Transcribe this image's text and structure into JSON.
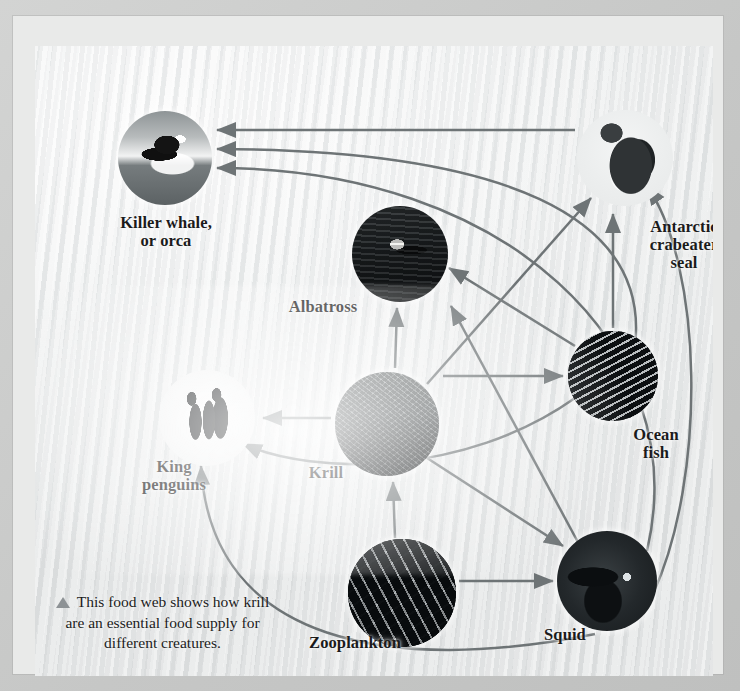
{
  "figure": {
    "type": "diagram",
    "caption_bullet": "triangle-bullet",
    "caption": "This food web\nshows how krill are an\nessential food supply\nfor different creatures.",
    "arrow_color": "#6e7476",
    "label_color": "#1b1b1b",
    "background_color": "#eceeee",
    "mat_color": "#c9cac9"
  },
  "nodes": [
    {
      "id": "orca",
      "label": "Killer whale,\nor orca",
      "photo": "breaching killer whale",
      "cx": 130,
      "cy": 112,
      "r": 47,
      "label_x": 36,
      "label_y": 168,
      "label_w": 190
    },
    {
      "id": "albatross",
      "label": "Albatross",
      "photo": "albatross in flight",
      "cx": 365,
      "cy": 208,
      "r": 48,
      "label_x": 218,
      "label_y": 252,
      "label_w": 140
    },
    {
      "id": "seal",
      "label": "Antarctic\ncrabeater\nseal",
      "photo": "crabeater seal on ice",
      "cx": 590,
      "cy": 112,
      "r": 48,
      "label_x": 584,
      "label_y": 172,
      "label_w": 130
    },
    {
      "id": "penguins",
      "label": "King\npenguins",
      "photo": "king penguins",
      "cx": 172,
      "cy": 372,
      "r": 48,
      "label_x": 74,
      "label_y": 412,
      "label_w": 130
    },
    {
      "id": "krill",
      "label": "Krill",
      "photo": "swarm of krill",
      "cx": 352,
      "cy": 378,
      "r": 52,
      "label_x": 246,
      "label_y": 418,
      "label_w": 90
    },
    {
      "id": "oceanfish",
      "label": "Ocean\nfish",
      "photo": "shoal of ocean fish",
      "cx": 578,
      "cy": 330,
      "r": 45,
      "label_x": 576,
      "label_y": 380,
      "label_w": 90
    },
    {
      "id": "zooplankton",
      "label": "Zooplankton",
      "photo": "zooplankton",
      "cx": 367,
      "cy": 547,
      "r": 54,
      "label_x": 230,
      "label_y": 588,
      "label_w": 180
    },
    {
      "id": "squid",
      "label": "Squid",
      "photo": "squid",
      "cx": 572,
      "cy": 535,
      "r": 50,
      "label_x": 480,
      "label_y": 580,
      "label_w": 100
    }
  ],
  "edges": [
    {
      "from": "seal",
      "to": "orca",
      "meaning": "eaten by"
    },
    {
      "from": "penguins",
      "to": "orca",
      "meaning": "eaten by"
    },
    {
      "from": "squid",
      "to": "orca",
      "meaning": "eaten by"
    },
    {
      "from": "penguins",
      "to": "orca",
      "meaning": "eaten by"
    },
    {
      "from": "krill",
      "to": "albatross",
      "meaning": "eaten by"
    },
    {
      "from": "squid",
      "to": "albatross",
      "meaning": "eaten by"
    },
    {
      "from": "oceanfish",
      "to": "albatross",
      "meaning": "eaten by"
    },
    {
      "from": "krill",
      "to": "seal",
      "meaning": "eaten by"
    },
    {
      "from": "oceanfish",
      "to": "seal",
      "meaning": "eaten by"
    },
    {
      "from": "squid",
      "to": "seal",
      "meaning": "eaten by"
    },
    {
      "from": "krill",
      "to": "penguins",
      "meaning": "eaten by"
    },
    {
      "from": "oceanfish",
      "to": "penguins",
      "meaning": "eaten by"
    },
    {
      "from": "squid",
      "to": "penguins",
      "meaning": "eaten by"
    },
    {
      "from": "krill",
      "to": "oceanfish",
      "meaning": "eaten by"
    },
    {
      "from": "krill",
      "to": "squid",
      "meaning": "eaten by"
    },
    {
      "from": "zooplankton",
      "to": "krill",
      "meaning": "eaten by"
    },
    {
      "from": "zooplankton",
      "to": "squid",
      "meaning": "eaten by"
    }
  ]
}
